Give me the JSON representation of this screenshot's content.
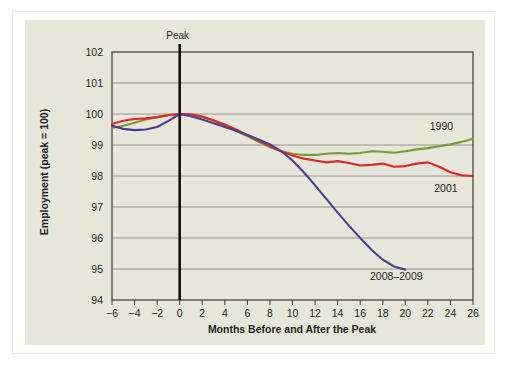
{
  "colors": {
    "page_background": "#ffffff",
    "panel_background": "#e6e6da",
    "frame_border": "#e8e8e4",
    "gridline": "#8c8c82",
    "axis": "#3a3a36",
    "peak_line": "#111111",
    "text": "#231f20",
    "series_1990": "#7a9a35",
    "series_2001": "#e02626",
    "series_2008_2009": "#4a3f8f"
  },
  "chart_data": {
    "type": "line",
    "title": "",
    "subtitle": "",
    "xlabel": "Months Before and After the Peak",
    "ylabel": "Employment (peak = 100)",
    "xlim": [
      -6,
      26
    ],
    "ylim": [
      94,
      102
    ],
    "xticks": [
      -6,
      -4,
      -2,
      0,
      2,
      4,
      6,
      8,
      10,
      12,
      14,
      16,
      18,
      20,
      22,
      24,
      26
    ],
    "xtick_labels": [
      "−6",
      "−4",
      "−2",
      "0",
      "2",
      "4",
      "6",
      "8",
      "10",
      "12",
      "14",
      "16",
      "18",
      "20",
      "22",
      "24",
      "26"
    ],
    "yticks": [
      94,
      95,
      96,
      97,
      98,
      99,
      100,
      101,
      102
    ],
    "ytick_labels": [
      "94",
      "95",
      "96",
      "97",
      "98",
      "99",
      "100",
      "101",
      "102"
    ],
    "grid": true,
    "legend_position": "inline-end-labels",
    "annotations": [
      {
        "name": "peak-marker",
        "text": "Peak",
        "x": 0,
        "kind": "vertical-line"
      }
    ],
    "series": [
      {
        "name": "1990",
        "label": "1990",
        "color": "#7a9a35",
        "label_x": 23.2,
        "label_y": 99.62,
        "x": [
          -6,
          -5,
          -4,
          -3,
          -2,
          -1,
          0,
          1,
          2,
          3,
          4,
          5,
          6,
          7,
          8,
          9,
          10,
          11,
          12,
          13,
          14,
          15,
          16,
          17,
          18,
          19,
          20,
          21,
          22,
          23,
          24,
          25,
          26
        ],
        "values": [
          99.55,
          99.62,
          99.72,
          99.82,
          99.9,
          99.97,
          100.0,
          99.97,
          99.9,
          99.78,
          99.63,
          99.46,
          99.28,
          99.1,
          98.93,
          98.8,
          98.72,
          98.68,
          98.68,
          98.72,
          98.74,
          98.72,
          98.74,
          98.8,
          98.78,
          98.75,
          98.8,
          98.86,
          98.9,
          98.96,
          99.02,
          99.1,
          99.2
        ]
      },
      {
        "name": "2001",
        "label": "2001",
        "color": "#e02626",
        "label_x": 23.6,
        "label_y": 97.62,
        "x": [
          -6,
          -5,
          -4,
          -3,
          -2,
          -1,
          0,
          1,
          2,
          3,
          4,
          5,
          6,
          7,
          8,
          9,
          10,
          11,
          12,
          13,
          14,
          15,
          16,
          17,
          18,
          19,
          20,
          21,
          22,
          23,
          24,
          25,
          26
        ],
        "values": [
          99.68,
          99.78,
          99.84,
          99.86,
          99.9,
          99.96,
          100.0,
          99.99,
          99.92,
          99.8,
          99.66,
          99.5,
          99.32,
          99.14,
          98.96,
          98.8,
          98.66,
          98.56,
          98.5,
          98.44,
          98.48,
          98.42,
          98.34,
          98.36,
          98.4,
          98.3,
          98.32,
          98.4,
          98.44,
          98.3,
          98.12,
          98.02,
          98.0
        ]
      },
      {
        "name": "2008–2009",
        "label": "2008–2009",
        "color": "#4a3f8f",
        "label_x": 19.2,
        "label_y": 94.78,
        "x": [
          -6,
          -5,
          -4,
          -3,
          -2,
          -1,
          0,
          1,
          2,
          3,
          4,
          5,
          6,
          7,
          8,
          9,
          10,
          11,
          12,
          13,
          14,
          15,
          16,
          17,
          18,
          19,
          20
        ],
        "values": [
          99.62,
          99.52,
          99.48,
          99.5,
          99.58,
          99.78,
          100.0,
          99.93,
          99.82,
          99.7,
          99.58,
          99.46,
          99.32,
          99.18,
          99.02,
          98.8,
          98.5,
          98.12,
          97.7,
          97.26,
          96.82,
          96.4,
          96.0,
          95.62,
          95.3,
          95.08,
          94.98
        ]
      }
    ]
  }
}
